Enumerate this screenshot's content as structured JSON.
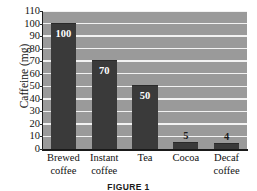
{
  "chart_data": {
    "type": "bar",
    "title": "",
    "xlabel": "",
    "ylabel": "Caffeine (mg)",
    "ylim": [
      0,
      110
    ],
    "ytick_step": 10,
    "grid": true,
    "legend": "none",
    "categories": [
      "Brewed coffee",
      "Instant coffee",
      "Tea",
      "Cocoa",
      "Decaf coffee"
    ],
    "category_lines": [
      [
        "Brewed",
        "coffee"
      ],
      [
        "Instant",
        "coffee"
      ],
      [
        "Tea",
        ""
      ],
      [
        "Cocoa",
        ""
      ],
      [
        "Decaf",
        "coffee"
      ]
    ],
    "values": [
      100,
      70,
      50,
      5,
      4
    ],
    "value_labels": [
      "100",
      "70",
      "50",
      "5",
      "4"
    ],
    "value_label_position": [
      "inside",
      "inside",
      "inside",
      "outside",
      "outside"
    ],
    "ytick_labels": [
      "110",
      "100",
      "90",
      "80",
      "70",
      "60",
      "50",
      "40",
      "30",
      "20",
      "10",
      "0"
    ],
    "ytick_values": [
      110,
      100,
      90,
      80,
      70,
      60,
      50,
      40,
      30,
      20,
      10,
      0
    ],
    "colors": {
      "bar": "#3a3a3a",
      "plot_background": "#9a9a9a",
      "gridline": "#f2f2f2",
      "axis": "#1a1a1a",
      "page_background": "#ffffff",
      "inside_label": "#ffffff",
      "outside_label": "#1a1a1a"
    }
  },
  "caption": {
    "text": "FIGURE 1"
  }
}
